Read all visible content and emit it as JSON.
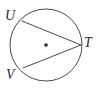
{
  "figure": {
    "kind": "circle-with-inscribed-angle",
    "background_color": "#ffffff",
    "stroke_color": "#4a4a4a",
    "label_color": "#2b2b2b",
    "stroke_width": 1,
    "circle": {
      "center_x": 46,
      "center_y": 45,
      "radius": 36,
      "center_dot_radius": 1.8,
      "center_dot_label": "",
      "has_center_dot": true
    },
    "points": [
      {
        "name": "U",
        "x": 22,
        "y": 21,
        "on_circle": true
      },
      {
        "name": "T",
        "x": 81,
        "y": 45,
        "on_circle": true
      },
      {
        "name": "V",
        "x": 23,
        "y": 68,
        "on_circle": true
      }
    ],
    "segments": [
      {
        "name": "chord-UT",
        "from": "U",
        "to": "T"
      },
      {
        "name": "chord-VT",
        "from": "V",
        "to": "T"
      }
    ],
    "labels": {
      "U": "U",
      "V": "V",
      "T": "T"
    }
  }
}
